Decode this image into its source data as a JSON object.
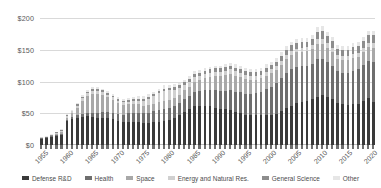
{
  "chart_data": {
    "type": "bar",
    "subtype": "stacked-bar",
    "title": "",
    "subtitle": "",
    "xlabel": "",
    "ylabel": "",
    "ylim": [
      0,
      200
    ],
    "ytick_values": [
      0,
      50,
      100,
      150,
      200
    ],
    "ytick_labels": [
      "$0",
      "$50",
      "$100",
      "$150",
      "$200"
    ],
    "grid": true,
    "legend_position": "bottom",
    "xtick_labels": [
      "1955",
      "1960",
      "1965",
      "1970",
      "1975",
      "1980",
      "1985",
      "1990",
      "1995",
      "2000",
      "2005",
      "2010",
      "2015",
      "2020"
    ],
    "categories": [
      1955,
      1956,
      1957,
      1958,
      1959,
      1960,
      1961,
      1962,
      1963,
      1964,
      1965,
      1966,
      1967,
      1968,
      1969,
      1970,
      1971,
      1972,
      1973,
      1974,
      1975,
      1976,
      1977,
      1978,
      1979,
      1980,
      1981,
      1982,
      1983,
      1984,
      1985,
      1986,
      1987,
      1988,
      1989,
      1990,
      1991,
      1992,
      1993,
      1994,
      1995,
      1996,
      1997,
      1998,
      1999,
      2000,
      2001,
      2002,
      2003,
      2004,
      2005,
      2006,
      2007,
      2008,
      2009,
      2010,
      2011,
      2012,
      2013,
      2014,
      2015,
      2016,
      2017,
      2018,
      2019,
      2020
    ],
    "series": [
      {
        "name": "Defense R&D",
        "color": "#3a3a3a",
        "values": [
          10,
          11,
          13,
          14,
          16,
          38,
          41,
          43,
          44,
          45,
          44,
          43,
          43,
          42,
          41,
          38,
          36,
          36,
          36,
          36,
          35,
          35,
          36,
          37,
          38,
          39,
          42,
          47,
          52,
          56,
          61,
          62,
          62,
          61,
          59,
          57,
          56,
          55,
          52,
          50,
          48,
          47,
          47,
          47,
          48,
          48,
          49,
          53,
          58,
          62,
          66,
          68,
          69,
          72,
          76,
          78,
          76,
          72,
          66,
          64,
          63,
          64,
          65,
          70,
          74,
          68
        ]
      },
      {
        "name": "Health",
        "color": "#6e6e6e",
        "values": [
          1,
          1,
          1,
          2,
          2,
          2,
          3,
          4,
          5,
          6,
          7,
          8,
          9,
          10,
          10,
          11,
          12,
          14,
          15,
          15,
          15,
          16,
          17,
          18,
          19,
          19,
          19,
          19,
          20,
          21,
          22,
          23,
          24,
          26,
          27,
          28,
          29,
          31,
          32,
          33,
          33,
          33,
          35,
          37,
          40,
          44,
          48,
          52,
          56,
          57,
          57,
          56,
          56,
          56,
          60,
          58,
          55,
          53,
          50,
          50,
          51,
          53,
          54,
          56,
          59,
          62
        ]
      },
      {
        "name": "Space",
        "color": "#a8a8a8",
        "values": [
          0,
          0,
          0,
          1,
          2,
          3,
          6,
          12,
          21,
          27,
          30,
          30,
          27,
          23,
          20,
          17,
          15,
          14,
          13,
          13,
          12,
          12,
          12,
          13,
          13,
          13,
          13,
          13,
          14,
          15,
          16,
          17,
          19,
          20,
          22,
          23,
          25,
          26,
          25,
          24,
          23,
          22,
          21,
          21,
          21,
          21,
          21,
          21,
          22,
          23,
          23,
          23,
          23,
          23,
          23,
          23,
          22,
          21,
          20,
          20,
          20,
          20,
          20,
          21,
          22,
          23
        ]
      },
      {
        "name": "Energy and Natural Res.",
        "color": "#d0d0d0",
        "values": [
          1,
          1,
          1,
          2,
          2,
          3,
          3,
          3,
          4,
          4,
          4,
          4,
          4,
          4,
          4,
          4,
          4,
          4,
          5,
          6,
          8,
          10,
          12,
          14,
          15,
          15,
          13,
          11,
          9,
          8,
          8,
          7,
          7,
          7,
          7,
          7,
          7,
          7,
          7,
          7,
          7,
          7,
          6,
          6,
          6,
          6,
          6,
          6,
          6,
          6,
          6,
          6,
          6,
          6,
          8,
          8,
          7,
          7,
          6,
          6,
          6,
          6,
          6,
          6,
          6,
          7
        ]
      },
      {
        "name": "General Science",
        "color": "#8d8d8d",
        "values": [
          0,
          0,
          1,
          1,
          1,
          1,
          1,
          2,
          2,
          2,
          3,
          3,
          3,
          3,
          3,
          3,
          3,
          3,
          3,
          3,
          3,
          3,
          3,
          3,
          4,
          4,
          4,
          4,
          4,
          4,
          5,
          5,
          5,
          5,
          6,
          6,
          6,
          6,
          6,
          6,
          6,
          6,
          6,
          6,
          7,
          7,
          7,
          8,
          8,
          9,
          9,
          9,
          9,
          10,
          11,
          12,
          11,
          11,
          10,
          10,
          10,
          11,
          11,
          11,
          12,
          13
        ]
      },
      {
        "name": "Other",
        "color": "#e6e6e6",
        "values": [
          1,
          1,
          1,
          1,
          2,
          2,
          2,
          2,
          3,
          3,
          3,
          3,
          3,
          3,
          3,
          3,
          3,
          3,
          3,
          4,
          4,
          4,
          4,
          4,
          5,
          5,
          5,
          4,
          4,
          4,
          4,
          4,
          4,
          4,
          4,
          4,
          5,
          5,
          5,
          5,
          5,
          5,
          5,
          5,
          5,
          5,
          6,
          6,
          6,
          6,
          6,
          6,
          6,
          6,
          8,
          8,
          7,
          6,
          6,
          6,
          6,
          6,
          6,
          6,
          7,
          7
        ]
      }
    ]
  },
  "axis": {
    "y_label_prefix": "$"
  },
  "legend": {
    "items": [
      {
        "label": "Defense R&D",
        "color": "#3a3a3a"
      },
      {
        "label": "Health",
        "color": "#6e6e6e"
      },
      {
        "label": "Space",
        "color": "#a8a8a8"
      },
      {
        "label": "Energy and Natural Res.",
        "color": "#d0d0d0"
      },
      {
        "label": "General Science",
        "color": "#8d8d8d"
      },
      {
        "label": "Other",
        "color": "#e6e6e6"
      }
    ]
  }
}
